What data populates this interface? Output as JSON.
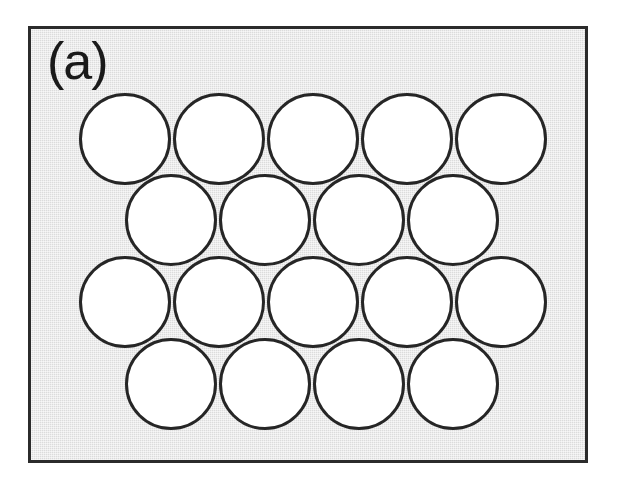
{
  "figure": {
    "panel_label": "(a)",
    "width": 625,
    "height": 490,
    "background_color": "#ffffff",
    "panel": {
      "x": 28,
      "y": 26,
      "width": 560,
      "height": 437,
      "fill_color": "#e4e4e4",
      "border_color": "#2b2b2b",
      "border_width": 3
    },
    "sphere_style": {
      "fill_color": "#ffffff",
      "outline_color": "#262626",
      "outline_width": 3,
      "diameter": 92
    }
  },
  "chart_data": {
    "type": "scatter",
    "title": "(a)",
    "xlabel": "",
    "ylabel": "",
    "units": "pixels",
    "circle_diameter": 92,
    "row_spacing": 82,
    "column_spacing": 94,
    "rows": [
      {
        "row": 1,
        "count": 5,
        "y_center": 136,
        "x_centers": [
          122,
          216,
          310,
          404,
          498
        ]
      },
      {
        "row": 2,
        "count": 4,
        "y_center": 217,
        "x_centers": [
          168,
          262,
          356,
          450
        ]
      },
      {
        "row": 3,
        "count": 5,
        "y_center": 299,
        "x_centers": [
          122,
          216,
          310,
          404,
          498
        ]
      },
      {
        "row": 4,
        "count": 4,
        "y_center": 381,
        "x_centers": [
          168,
          262,
          356,
          450
        ]
      }
    ],
    "total_circles": 18,
    "legend": [],
    "grid": false
  }
}
